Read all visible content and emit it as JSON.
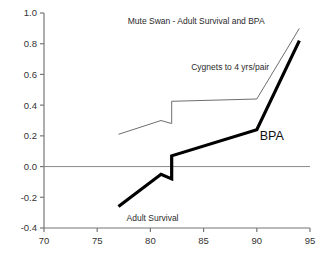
{
  "chart_data": {
    "type": "line",
    "title": "Mute Swan - Adult Survival and BPA",
    "xlabel": "",
    "ylabel": "",
    "xlim": [
      70,
      95
    ],
    "ylim": [
      -0.4,
      1.0
    ],
    "xticks": [
      70,
      75,
      80,
      85,
      90,
      95
    ],
    "yticks": [
      -0.4,
      -0.2,
      0.0,
      0.2,
      0.4,
      0.6,
      0.8,
      1.0
    ],
    "xtick_labels": [
      "70",
      "75",
      "80",
      "85",
      "90",
      "95"
    ],
    "ytick_labels": [
      "-0.4",
      "-0.2",
      "0.0",
      "0.2",
      "0.4",
      "0.6",
      "0.8",
      "1.0"
    ],
    "grid": false,
    "legend_position": "inline-annotations",
    "zero_line": 0.0,
    "series": [
      {
        "name": "Adult Survival",
        "style": "thick",
        "color": "#000000",
        "linewidth": 3.2,
        "annotation": "Adult  Survival",
        "annotation2": "BPA",
        "x": [
          77,
          81,
          82,
          82,
          90,
          94
        ],
        "values": [
          -0.26,
          -0.05,
          -0.08,
          0.07,
          0.24,
          0.82
        ]
      },
      {
        "name": "Cygnets to 4 yrs/pair",
        "style": "thin",
        "color": "#6e6e6e",
        "linewidth": 1,
        "annotation": "Cygnets to 4 yrs/pair",
        "x": [
          77,
          81,
          82,
          82,
          90,
          94
        ],
        "values": [
          0.21,
          0.3,
          0.28,
          0.425,
          0.44,
          0.9
        ]
      }
    ],
    "annotations": [
      {
        "text": "Mute Swan - Adult Survival and BPA",
        "x": 84.3,
        "y": 0.93
      },
      {
        "text": "Cygnets to 4 yrs/pair",
        "x": 87.5,
        "y": 0.63
      },
      {
        "text": "BPA",
        "x": 91.4,
        "y": 0.175
      },
      {
        "text": "Adult  Survival",
        "x": 80.2,
        "y": -0.355
      }
    ]
  },
  "axes": {
    "axis_color": "#777777",
    "zero_line_color": "#8a8a8a"
  }
}
